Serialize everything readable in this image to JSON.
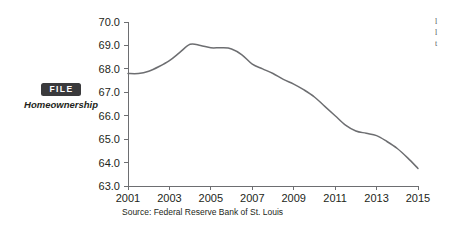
{
  "figure": {
    "badge_label": "FILE",
    "caption": "Homeownership",
    "source": "Source: Federal Reserve Bank of St. Louis"
  },
  "colors": {
    "badge_bg": "#3a3a3c",
    "badge_text": "#ffffff",
    "line": "#6d6e71",
    "axis": "#6d6e71",
    "text": "#231f20",
    "background": "#ffffff"
  },
  "margin_text": {
    "line1": "l",
    "line2": "l",
    "line3": "t"
  },
  "chart_data": {
    "type": "line",
    "title": "",
    "xlabel": "",
    "ylabel": "",
    "xlim": [
      2001,
      2015
    ],
    "ylim": [
      63.0,
      70.0
    ],
    "grid": false,
    "legend": "none",
    "ytick_labels": [
      "63.0",
      "64.0",
      "65.0",
      "66.0",
      "67.0",
      "68.0",
      "69.0",
      "70.0"
    ],
    "ytick_values": [
      63.0,
      64.0,
      65.0,
      66.0,
      67.0,
      68.0,
      69.0,
      70.0
    ],
    "xtick_labels": [
      "2001",
      "2003",
      "2005",
      "2007",
      "2009",
      "2011",
      "2013",
      "2015"
    ],
    "xtick_values": [
      2001,
      2003,
      2005,
      2007,
      2009,
      2011,
      2013,
      2015
    ],
    "series": [
      {
        "name": "Homeownership rate",
        "x": [
          2001,
          2001.5,
          2002,
          2002.5,
          2003,
          2003.5,
          2004,
          2004.5,
          2005,
          2005.5,
          2006,
          2006.5,
          2007,
          2007.5,
          2008,
          2008.5,
          2009,
          2009.5,
          2010,
          2010.5,
          2011,
          2011.5,
          2012,
          2012.5,
          2013,
          2013.5,
          2014,
          2014.5,
          2015
        ],
        "values": [
          67.8,
          67.8,
          67.9,
          68.1,
          68.35,
          68.7,
          69.05,
          69.0,
          68.9,
          68.9,
          68.85,
          68.6,
          68.2,
          68.0,
          67.8,
          67.55,
          67.35,
          67.1,
          66.8,
          66.4,
          66.0,
          65.6,
          65.35,
          65.25,
          65.15,
          64.9,
          64.6,
          64.2,
          63.75
        ]
      }
    ]
  },
  "plot_geometry": {
    "left": 128,
    "right": 418,
    "top": 22,
    "bottom": 186
  }
}
